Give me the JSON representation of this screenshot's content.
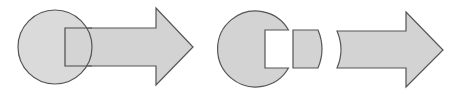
{
  "diagram": {
    "colors": {
      "fill": "#d3d3d3",
      "stroke": "#555555",
      "background": "#ffffff"
    },
    "left_group": {
      "circle": {
        "cx": 55,
        "cy": 47,
        "r": 37
      },
      "arrow": {
        "shaft_left": 65,
        "shaft_top": 28,
        "shaft_bottom": 66,
        "head_base": 156,
        "head_top": 8,
        "head_bottom": 85,
        "tip_x": 193,
        "tip_y": 47
      }
    },
    "right_group": {
      "notched_circle": {
        "cx": 256,
        "cy": 50,
        "r": 38,
        "notch_left": 265,
        "notch_top": 30,
        "notch_bottom": 68
      },
      "lens_piece": {
        "left": 293,
        "top": 30,
        "bottom": 68,
        "right": 318,
        "bulge": 322
      },
      "concave_arrow": {
        "tail_left": 337,
        "tail_concave": 343,
        "shaft_top": 31,
        "shaft_bottom": 68,
        "head_base": 406,
        "head_top": 12,
        "head_bottom": 87,
        "tip_x": 443,
        "tip_y": 50
      }
    }
  }
}
